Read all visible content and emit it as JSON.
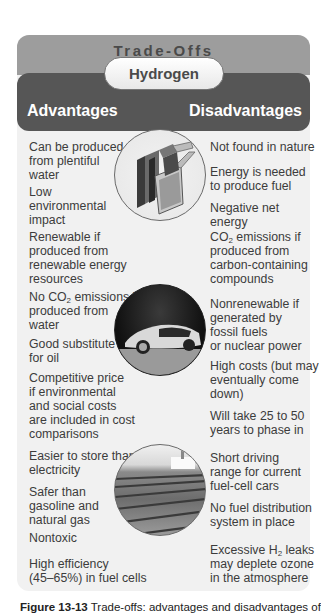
{
  "header": {
    "title": "Trade-Offs",
    "subject": "Hydrogen",
    "advantages_label": "Advantages",
    "disadvantages_label": "Disadvantages"
  },
  "advantages": [
    {
      "text": "Can be produced\nfrom plentiful\nwater"
    },
    {
      "text": "Low\nenvironmental\nimpact"
    },
    {
      "text": "Renewable if\nproduced from\nrenewable energy\nresources"
    },
    {
      "pre": "No CO",
      "sub": "2",
      "post": " emissions if\nproduced from\nwater"
    },
    {
      "text": "Good substitute\nfor oil"
    },
    {
      "text": "Competitive price\nif environmental\nand social costs\nare included in cost\ncomparisons"
    },
    {
      "text": "Easier to store than\nelectricity"
    },
    {
      "text": "Safer than\ngasoline and\nnatural gas"
    },
    {
      "text": "Nontoxic"
    },
    {
      "text": "High efficiency\n(45–65%) in fuel cells"
    }
  ],
  "disadvantages": [
    {
      "text": "Not found in nature"
    },
    {
      "text": "Energy is needed\nto produce fuel"
    },
    {
      "text": "Negative net energy"
    },
    {
      "pre": "CO",
      "sub": "2",
      "post": " emissions if\nproduced from\ncarbon-containing\ncompounds"
    },
    {
      "text": "Nonrenewable if\ngenerated by\nfossil fuels\nor nuclear power"
    },
    {
      "text": "High costs (but may\neventually come\ndown)"
    },
    {
      "text": "Will take 25 to 50\nyears to phase in"
    },
    {
      "text": "Short driving\nrange for current\nfuel-cell cars"
    },
    {
      "text": "No fuel distribution\nsystem in place"
    },
    {
      "pre": "Excessive H",
      "sub": "2",
      "post": " leaks\nmay deplete ozone\nin the atmosphere"
    }
  ],
  "images": [
    {
      "name": "fuel-cell-stack-image"
    },
    {
      "name": "hydrogen-car-image"
    },
    {
      "name": "solar-array-image"
    }
  ],
  "caption": {
    "label": "Figure 13-13",
    "text": " Trade-offs: advantages and disadvantages of"
  },
  "colors": {
    "band_top": "#9d9d9d",
    "band_dark": "#565656",
    "panel_bg": "#f1f1f1"
  }
}
